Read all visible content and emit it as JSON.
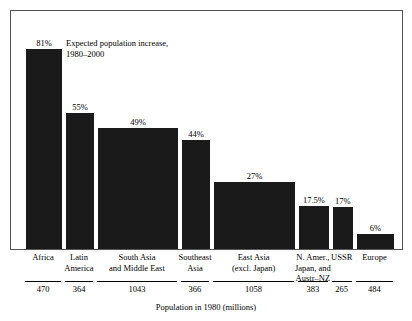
{
  "chart_data": {
    "type": "bar",
    "title": "",
    "annotation": [
      "Expected population increase,",
      "1980–2000"
    ],
    "xlabel": "Population in 1980 (millions)",
    "ylabel": "",
    "note": "Variable-width bar chart: bar width is proportional to 1980 population (millions); bar height is the expected percentage population increase 1980–2000.",
    "grid": false,
    "legend": "none",
    "ylim": [
      0,
      85
    ],
    "categories": [
      "Africa",
      "Latin America",
      "South Asia and Middle East",
      "Southeast Asia",
      "East Asia (excl. Japan)",
      "N. Amer., Japan, and Austr–NZ",
      "USSR",
      "Europe"
    ],
    "category_lines": [
      [
        "Africa"
      ],
      [
        "Latin",
        "America"
      ],
      [
        "South Asia",
        "and Middle East"
      ],
      [
        "Southeast",
        "Asia"
      ],
      [
        "East Asia",
        "(excl. Japan)"
      ],
      [
        "N. Amer.,",
        "Japan, and",
        "Austr–NZ"
      ],
      [
        "USSR"
      ],
      [
        "Europe"
      ]
    ],
    "values": [
      81,
      55,
      49,
      44,
      27,
      17.5,
      17,
      6
    ],
    "value_labels": [
      "81%",
      "55%",
      "49%",
      "44%",
      "27%",
      "17.5%",
      "17%",
      "6%"
    ],
    "widths": [
      470,
      364,
      1043,
      366,
      1058,
      383,
      265,
      484
    ],
    "width_labels": [
      "470",
      "364",
      "1043",
      "366",
      "1058",
      "383",
      "265",
      "484"
    ],
    "bar_color": "#1a1a1a",
    "background_color": "#ffffff",
    "border_color": "#555555"
  }
}
